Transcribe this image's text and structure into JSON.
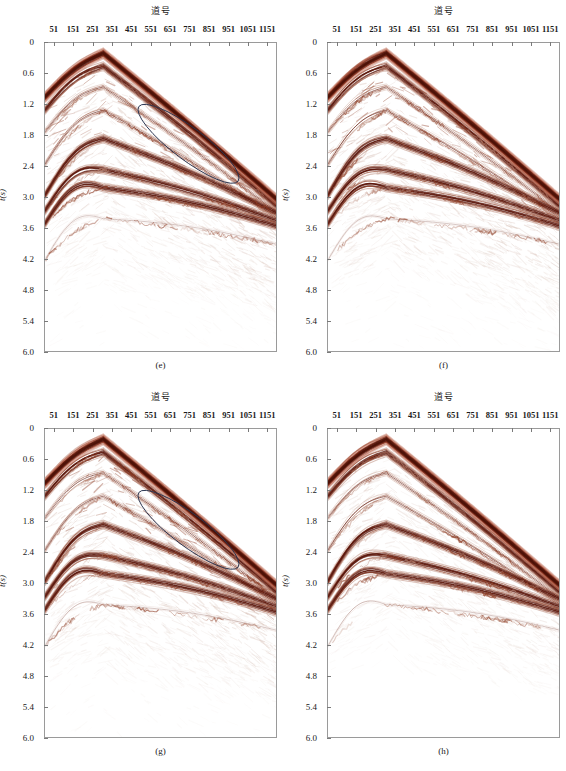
{
  "figure": {
    "width": 566,
    "height": 771,
    "background": "#ffffff",
    "panel_count": 4
  },
  "axes": {
    "x_title": "道号",
    "y_title": "t(s)",
    "x_ticks": [
      51,
      151,
      251,
      351,
      451,
      551,
      651,
      751,
      851,
      951,
      1051,
      1151
    ],
    "x_tick_labels": [
      "51",
      "151",
      "251",
      "351",
      "451",
      "551",
      "651",
      "751",
      "851",
      "951",
      "1051",
      "1151"
    ],
    "y_ticks": [
      0,
      0.6,
      1.2,
      1.8,
      2.4,
      3.0,
      3.6,
      4.2,
      4.8,
      5.4,
      6.0
    ],
    "y_tick_labels": [
      "0",
      "0.6",
      "1.2",
      "1.8",
      "2.4",
      "3.0",
      "3.6",
      "4.2",
      "4.8",
      "5.4",
      "6.0"
    ],
    "xlim": [
      1,
      1201
    ],
    "ylim": [
      0,
      6.0
    ],
    "y_inverted": true,
    "grid": false,
    "frame_color": "#9a9a9a"
  },
  "colors": {
    "event_dark": "#5a1408",
    "event_mid": "#8c3a22",
    "event_light": "#b5806e",
    "event_faint": "#c9a99c",
    "annotation_ellipse": "#2a3550",
    "background": "#ffffff",
    "text": "#1a1a1a"
  },
  "chart_data": {
    "type": "line",
    "title": "",
    "xlabel": "道号",
    "ylabel": "t(s)",
    "xlim": [
      1,
      1201
    ],
    "ylim": [
      0,
      6.0
    ],
    "grid": false,
    "apex": {
      "trace": 301,
      "time": 0.2
    },
    "panels": [
      {
        "label": "(e)",
        "has_ellipse_annotation": true,
        "ellipse": {
          "center_trace": 740,
          "center_time": 1.95,
          "width": 640,
          "height": 0.62,
          "rotation_deg": 37
        },
        "noise_level": "high"
      },
      {
        "label": "(f)",
        "has_ellipse_annotation": false,
        "noise_level": "high"
      },
      {
        "label": "(g)",
        "has_ellipse_annotation": true,
        "ellipse": {
          "center_trace": 740,
          "center_time": 1.95,
          "width": 640,
          "height": 0.62,
          "rotation_deg": 37
        },
        "noise_level": "high"
      },
      {
        "label": "(h)",
        "has_ellipse_annotation": false,
        "noise_level": "medium"
      }
    ],
    "events": [
      {
        "name": "direct-arrival",
        "apex_time": 0.2,
        "left_edge_time": 1.05,
        "right_edge_time": 3.05,
        "amplitude": "strong"
      },
      {
        "name": "reflector-1",
        "apex_time": 0.45,
        "left_edge_time": 1.3,
        "right_edge_time": 3.18,
        "amplitude": "strong"
      },
      {
        "name": "reflector-2",
        "apex_time": 0.85,
        "left_edge_time": 1.72,
        "right_edge_time": 3.3,
        "amplitude": "medium"
      },
      {
        "name": "reflector-3",
        "apex_time": 1.3,
        "left_edge_time": 2.35,
        "right_edge_time": 3.4,
        "amplitude": "medium"
      },
      {
        "name": "reflector-4",
        "apex_time": 1.85,
        "left_edge_time": 2.95,
        "right_edge_time": 3.3,
        "amplitude": "strong"
      },
      {
        "name": "reflector-5",
        "apex_time": 2.45,
        "left_edge_time": 3.25,
        "right_edge_time": 3.45,
        "amplitude": "strong"
      },
      {
        "name": "reflector-6",
        "apex_time": 2.8,
        "left_edge_time": 3.5,
        "right_edge_time": 3.55,
        "amplitude": "strong"
      },
      {
        "name": "diffraction-tail",
        "apex_time": 3.4,
        "left_edge_time": 4.2,
        "right_edge_time": 3.9,
        "amplitude": "weak"
      }
    ]
  },
  "captions": {
    "e": "(e)",
    "f": "(f)",
    "g": "(g)",
    "h": "(h)"
  }
}
